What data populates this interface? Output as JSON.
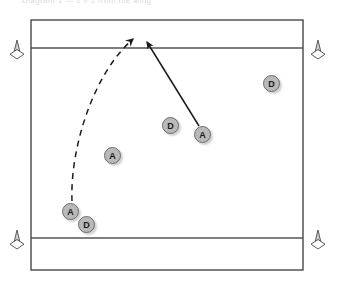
{
  "caption": {
    "text": "Diagram 1 — 1 v 1 from the wing"
  },
  "field": {
    "outline_color": "#3a3a3a",
    "zone_line_color": "#555555",
    "background": "#ffffff",
    "outline": {
      "x": 31,
      "y": 20,
      "width": 272,
      "height": 250
    },
    "zone_lines": [
      {
        "name": "upper-restraining-line",
        "y": 48
      },
      {
        "name": "lower-restraining-line",
        "y": 238
      }
    ]
  },
  "cones": [
    {
      "name": "cone-top-left",
      "x": 17,
      "y": 48,
      "label": "cone"
    },
    {
      "name": "cone-top-right",
      "x": 318,
      "y": 48,
      "label": "cone"
    },
    {
      "name": "cone-bottom-left",
      "x": 17,
      "y": 238,
      "label": "cone"
    },
    {
      "name": "cone-bottom-right",
      "x": 318,
      "y": 238,
      "label": "cone"
    }
  ],
  "cone_color": "#ffffff",
  "cone_stroke": "#555555",
  "players": [
    {
      "id": "attack-1",
      "label": "A",
      "x": 70,
      "y": 211,
      "team": "attack"
    },
    {
      "id": "defense-1",
      "label": "D",
      "x": 86,
      "y": 224,
      "team": "defense"
    },
    {
      "id": "attack-2",
      "label": "A",
      "x": 112,
      "y": 155,
      "team": "attack"
    },
    {
      "id": "defense-2",
      "label": "D",
      "x": 170,
      "y": 125,
      "team": "defense"
    },
    {
      "id": "attack-3",
      "label": "A",
      "x": 202,
      "y": 134,
      "team": "attack"
    },
    {
      "id": "defense-3",
      "label": "D",
      "x": 271,
      "y": 83,
      "team": "defense"
    }
  ],
  "player_style": {
    "fill": "#b9b9b9",
    "stroke": "#6e6e6e",
    "text_color": "#1a1a1a"
  },
  "paths": [
    {
      "name": "dashed-run-path",
      "style": "dashed",
      "color": "#1a1a1a",
      "start": {
        "x": 72,
        "y": 200
      },
      "control": {
        "x": 72,
        "y": 100
      },
      "end": {
        "x": 133,
        "y": 38
      },
      "arrowhead": "open"
    },
    {
      "name": "solid-movement-path",
      "style": "solid",
      "color": "#1a1a1a",
      "start": {
        "x": 199,
        "y": 126
      },
      "end": {
        "x": 147,
        "y": 41
      },
      "arrowhead": "filled"
    }
  ]
}
